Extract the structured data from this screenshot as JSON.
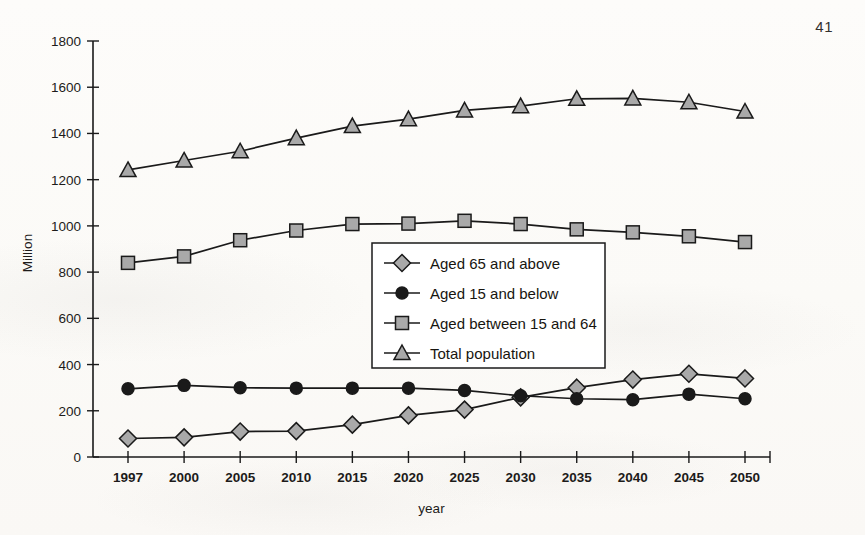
{
  "page": {
    "number": "41"
  },
  "chart_data": {
    "type": "line",
    "title": "",
    "xlabel": "year",
    "ylabel": "Million",
    "ylim": [
      0,
      1800
    ],
    "ytick_step": 200,
    "yticks": [
      "0",
      "200",
      "400",
      "600",
      "800",
      "1000",
      "1200",
      "1400",
      "1600",
      "1800"
    ],
    "grid": false,
    "legend_position": "center",
    "categories": [
      "1997",
      "2000",
      "2005",
      "2010",
      "2015",
      "2020",
      "2025",
      "2030",
      "2035",
      "2040",
      "2045",
      "2050"
    ],
    "series": [
      {
        "name": "Aged 65 and above",
        "marker": "diamond",
        "marker_fill": "#a9a9a9",
        "values": [
          80,
          85,
          110,
          112,
          140,
          180,
          205,
          258,
          300,
          335,
          360,
          340
        ]
      },
      {
        "name": "Aged 15 and below",
        "marker": "circle",
        "marker_fill": "#1a1a1a",
        "values": [
          295,
          310,
          300,
          298,
          298,
          298,
          288,
          265,
          252,
          248,
          272,
          252
        ]
      },
      {
        "name": "Aged between 15 and 64",
        "marker": "square",
        "marker_fill": "#a9a9a9",
        "values": [
          840,
          868,
          938,
          980,
          1008,
          1010,
          1022,
          1008,
          985,
          972,
          955,
          930
        ]
      },
      {
        "name": "Total population",
        "marker": "triangle",
        "marker_fill": "#a9a9a9",
        "values": [
          1242,
          1283,
          1323,
          1380,
          1432,
          1462,
          1500,
          1518,
          1550,
          1552,
          1535,
          1495
        ]
      }
    ]
  },
  "colors": {
    "axis": "#1a1a1a",
    "marker_gray": "#a9a9a9",
    "marker_dark": "#1a1a1a",
    "background": "#fbfaf8"
  }
}
